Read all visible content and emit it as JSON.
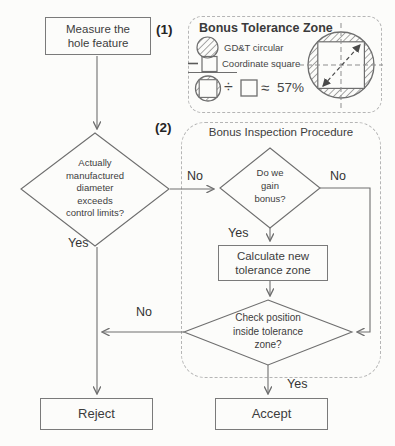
{
  "badges": {
    "one": "(1)",
    "two": "(2)"
  },
  "legend": {
    "title": "Bonus Tolerance Zone",
    "items": [
      {
        "icon": "hatched-circle-icon",
        "label": "GD&T circular"
      },
      {
        "icon": "dash-square-icon",
        "label": "Coordinate square"
      }
    ],
    "formula": {
      "lhs_icon": "circle-square-icon",
      "divide": "÷",
      "rhs_icon": "square-icon",
      "approx": "≈",
      "value": "57%"
    }
  },
  "procedure": {
    "title": "Bonus Inspection Procedure"
  },
  "nodes": {
    "measure": "Measure the\nhole feature",
    "exceeds": "Actually\nmanufactured\ndiameter\nexceeds\ncontrol limits?",
    "gain": "Do we\ngain\nbonus?",
    "calculate": "Calculate new\ntolerance zone",
    "check": "Check position\ninside tolerance\nzone?",
    "reject": "Reject",
    "accept": "Accept"
  },
  "edge_labels": {
    "exceeds_no": "No",
    "exceeds_yes": "Yes",
    "gain_no": "No",
    "gain_yes": "Yes",
    "check_no": "No",
    "check_yes": "Yes"
  },
  "colors": {
    "line": "#6e6e6e",
    "box_border": "#7a7a7a",
    "dashed_border": "#b5b5b5",
    "text": "#3d3d3d",
    "background": "#fcfcfa"
  }
}
